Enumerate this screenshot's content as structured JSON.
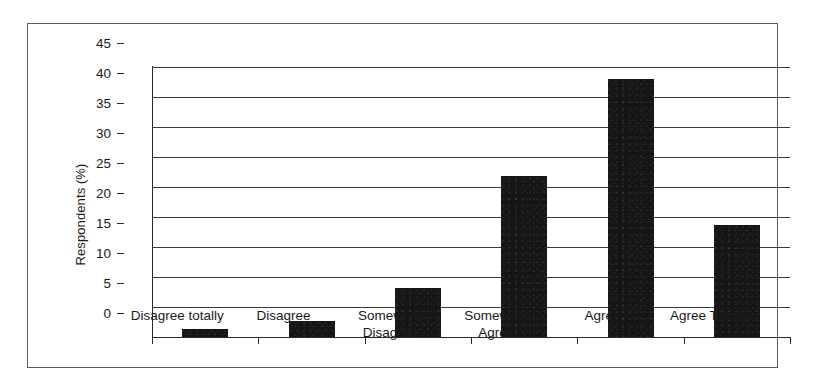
{
  "figure": {
    "background_color": "#ffffff",
    "frame_color": "#5b5b5b",
    "bar_color": "#151515",
    "axis_color": "#2a2a2a"
  },
  "chart_data": {
    "type": "bar",
    "title": "",
    "xlabel": "",
    "ylabel": "Respondents (%)",
    "categories": [
      "Disagree totally",
      "Disagree",
      "Somewhat\nDisagree",
      "Somewhat\nAgree",
      "Agree",
      "Agree Totally"
    ],
    "values": [
      1.3,
      2.7,
      8.2,
      26.9,
      43.0,
      18.7
    ],
    "ylim": [
      0,
      45
    ],
    "ytick_labels": [
      "0",
      "5",
      "10",
      "15",
      "20",
      "25",
      "30",
      "35",
      "40",
      "45"
    ],
    "ytick_values": [
      0,
      5,
      10,
      15,
      20,
      25,
      30,
      35,
      40,
      45
    ],
    "grid": true,
    "grid_axis": "y",
    "legend": false,
    "legend_position": "none"
  }
}
